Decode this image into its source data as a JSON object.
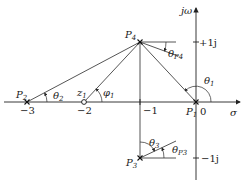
{
  "diagram": {
    "type": "s-plane pole-zero diagram",
    "axes": {
      "real_label": "σ",
      "imag_label": "jω",
      "origin_label": "0"
    },
    "ticks": {
      "real": [
        {
          "value": -3,
          "label": "−3"
        },
        {
          "value": -2,
          "label": "−2"
        },
        {
          "value": -1,
          "label": "−1"
        }
      ],
      "imag": [
        {
          "value": 1,
          "label": "+1j"
        },
        {
          "value": -1,
          "label": "−1j"
        }
      ]
    },
    "points": [
      {
        "id": "P1",
        "label": "P",
        "sub": "1",
        "kind": "pole",
        "s": "0"
      },
      {
        "id": "P2",
        "label": "P",
        "sub": "2",
        "kind": "pole",
        "s": "-3"
      },
      {
        "id": "P3",
        "label": "P",
        "sub": "3",
        "kind": "pole",
        "s": "-1-j"
      },
      {
        "id": "P4",
        "label": "P",
        "sub": "4",
        "kind": "pole",
        "s": "-1+j"
      },
      {
        "id": "z1",
        "label": "z",
        "sub": "1",
        "kind": "zero",
        "s": "-2"
      }
    ],
    "angles": {
      "theta1": {
        "label": "θ",
        "sub": "1"
      },
      "theta2": {
        "label": "θ",
        "sub": "2"
      },
      "theta3": {
        "label": "θ",
        "sub": "3"
      },
      "phi1": {
        "label": "φ",
        "sub": "1"
      },
      "thetaP4": {
        "label": "θ",
        "sub": "P4"
      },
      "thetaP3": {
        "label": "θ",
        "sub": "P3"
      }
    }
  }
}
